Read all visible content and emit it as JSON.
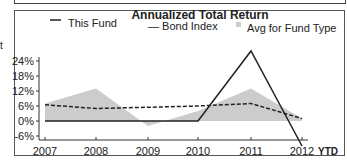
{
  "page": {
    "cut_text": "t"
  },
  "chart_data": {
    "type": "line",
    "title": "Annualized Total Return",
    "xlabel": "",
    "ylabel": "",
    "categories": [
      "2007",
      "2008",
      "2009",
      "2010",
      "2011",
      "2012"
    ],
    "x_suffix_label": "YTD",
    "yticks": [
      "24%",
      "18%",
      "12%",
      "6%",
      "0%",
      "-6%"
    ],
    "ylim": [
      -10,
      28
    ],
    "grid": false,
    "legend_position": "top",
    "series": [
      {
        "name": "This Fund",
        "style": "solid",
        "color": "#222222",
        "values": [
          0,
          0,
          0,
          0,
          28,
          -10
        ]
      },
      {
        "name": "Bond Index",
        "style": "dashed",
        "color": "#222222",
        "values": [
          6.5,
          5,
          5.5,
          6,
          7,
          1
        ]
      },
      {
        "name": "Avg for Fund Type",
        "style": "area",
        "color": "#cccccc",
        "values": [
          7,
          13,
          -2,
          4,
          13,
          1
        ]
      }
    ]
  },
  "legend": {
    "this_fund": "This Fund",
    "bond_index": "— Bond Index",
    "avg": "Avg for Fund Type"
  }
}
